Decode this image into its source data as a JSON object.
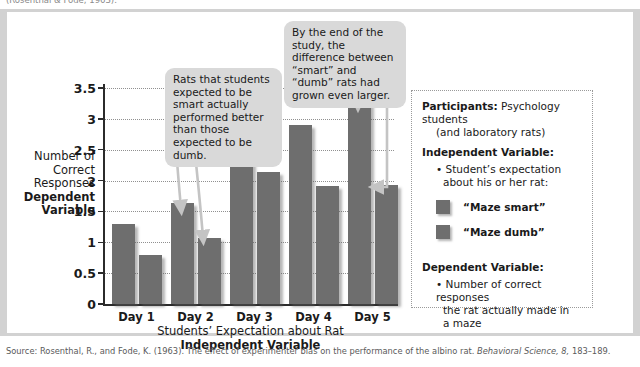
{
  "top_caption": "(Rosenthal & Fode, 1963).",
  "chart_data": {
    "type": "bar",
    "title": "",
    "categories": [
      "Day 1",
      "Day 2",
      "Day 3",
      "Day 4",
      "Day 5"
    ],
    "series": [
      {
        "name": "“Maze smart”",
        "values": [
          1.3,
          1.65,
          2.6,
          2.9,
          3.28
        ],
        "color": "#6e6e6e"
      },
      {
        "name": "“Maze dumb”",
        "values": [
          0.8,
          1.08,
          2.15,
          1.92,
          1.93
        ],
        "color": "#6e6e6e"
      }
    ],
    "ylim": [
      0,
      3.5
    ],
    "yticks": [
      "0",
      "0.5",
      "1",
      "1.5",
      "2",
      "2.5",
      "3",
      "3.5"
    ],
    "ytick_values": [
      0,
      0.5,
      1,
      1.5,
      2,
      2.5,
      3,
      3.5
    ],
    "ylabel_line1": "Number of",
    "ylabel_line2": "Correct",
    "ylabel_line3": "Responses",
    "ylabel_bold1": "Dependent",
    "ylabel_bold2": "Variable",
    "xlabel_line1": "Students’ Expectation about Rat",
    "xlabel_bold": "Independent Variable",
    "grid": true,
    "legend_position": "right-panel"
  },
  "callouts": {
    "left": "Rats that students expected to be smart actually performed better than those expected to be dumb.",
    "right": "By the end of the study, the difference between “smart” and “dumb” rats had grown even larger."
  },
  "info_panel": {
    "participants_label": "Participants:",
    "participants_value": "Psychology students",
    "participants_value2": "(and laboratory rats)",
    "iv_label": "Independent Variable:",
    "iv_bullet_line1": "• Student’s expectation",
    "iv_bullet_line2": "about his or her rat:",
    "legend": [
      {
        "label": "“Maze smart”",
        "color": "#6e6e6e"
      },
      {
        "label": "“Maze dumb”",
        "color": "#6e6e6e"
      }
    ],
    "dv_label": "Dependent Variable:",
    "dv_bullet_line1": "• Number of correct responses",
    "dv_bullet_line2": "the rat actually made in",
    "dv_bullet_line3": "a maze"
  },
  "source": {
    "prefix": "Source: Rosenthal, R., and Fode, K. (1963). The effect of experimenter bias on the performance of the albino rat. ",
    "italic": "Behavioral Science, 8,",
    "suffix": " 183–189."
  }
}
